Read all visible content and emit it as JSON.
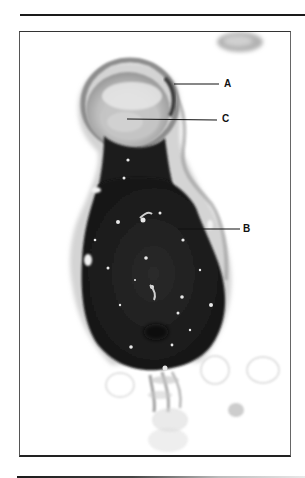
{
  "figure": {
    "type": "micrograph",
    "labels": [
      {
        "id": "A",
        "text": "A",
        "x": 224,
        "y": 84,
        "line_from_x": 174,
        "line_to_x": 219
      },
      {
        "id": "C",
        "text": "C",
        "x": 222,
        "y": 119,
        "line_from_x": 127,
        "line_to_x": 217
      },
      {
        "id": "B",
        "text": "B",
        "x": 243,
        "y": 229,
        "line_from_x": 178,
        "line_to_x": 240
      }
    ],
    "colors": {
      "dark_body": "#1e1e1e",
      "head_gray": "#8a8a8a",
      "head_light": "#cfcfcf",
      "membrane": "#a0a0a0",
      "frame": "#333333",
      "rule": "#1a1a1a"
    }
  }
}
